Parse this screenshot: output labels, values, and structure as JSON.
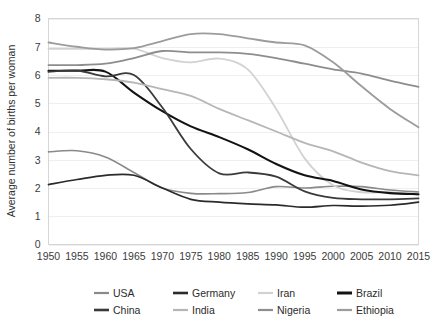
{
  "chart_data": {
    "type": "line",
    "title": "",
    "xlabel": "",
    "ylabel": "Average number of births per woman",
    "xlim": [
      1950,
      2015
    ],
    "ylim": [
      0,
      8
    ],
    "grid": true,
    "legend_position": "bottom",
    "x": [
      1950,
      1955,
      1960,
      1965,
      1970,
      1975,
      1980,
      1985,
      1990,
      1995,
      2000,
      2005,
      2010,
      2015
    ],
    "xtick_labels": [
      "1950",
      "1955",
      "1960",
      "1965",
      "1970",
      "1975",
      "1980",
      "1985",
      "1990",
      "1995",
      "2000",
      "2005",
      "2010",
      "2015"
    ],
    "ytick_labels": [
      "0",
      "1",
      "2",
      "3",
      "4",
      "5",
      "6",
      "7",
      "8"
    ],
    "ytick_values": [
      0,
      1,
      2,
      3,
      4,
      5,
      6,
      7,
      8
    ],
    "series": [
      {
        "name": "USA",
        "color": "#8a8a8a",
        "width": 1.6,
        "values": [
          3.28,
          3.32,
          3.1,
          2.55,
          2.0,
          1.81,
          1.8,
          1.84,
          2.05,
          2.0,
          2.06,
          2.05,
          1.93,
          1.86
        ]
      },
      {
        "name": "Germany",
        "color": "#2b2b2b",
        "width": 1.7,
        "values": [
          2.12,
          2.3,
          2.45,
          2.45,
          2.0,
          1.6,
          1.5,
          1.44,
          1.4,
          1.32,
          1.38,
          1.36,
          1.39,
          1.5
        ]
      },
      {
        "name": "Iran",
        "color": "#d2d2d2",
        "width": 1.8,
        "values": [
          6.93,
          6.93,
          6.93,
          6.93,
          6.6,
          6.45,
          6.58,
          6.2,
          4.8,
          3.05,
          2.1,
          1.85,
          1.85,
          1.75
        ]
      },
      {
        "name": "Brazil",
        "color": "#131313",
        "width": 2.1,
        "values": [
          6.15,
          6.15,
          6.12,
          5.38,
          4.72,
          4.18,
          3.8,
          3.37,
          2.85,
          2.45,
          2.25,
          1.95,
          1.82,
          1.78
        ]
      },
      {
        "name": "China",
        "color": "#3a3a3a",
        "width": 1.8,
        "values": [
          6.11,
          6.16,
          5.95,
          6.0,
          4.85,
          3.38,
          2.52,
          2.55,
          2.4,
          1.88,
          1.65,
          1.6,
          1.6,
          1.63
        ]
      },
      {
        "name": "India",
        "color": "#b6b6b6",
        "width": 1.8,
        "values": [
          5.9,
          5.9,
          5.85,
          5.73,
          5.5,
          5.26,
          4.8,
          4.4,
          4.0,
          3.6,
          3.3,
          2.9,
          2.6,
          2.45
        ]
      },
      {
        "name": "Nigeria",
        "color": "#8d8d8d",
        "width": 1.8,
        "values": [
          6.35,
          6.35,
          6.4,
          6.6,
          6.85,
          6.8,
          6.8,
          6.75,
          6.6,
          6.4,
          6.2,
          6.05,
          5.8,
          5.58
        ]
      },
      {
        "name": "Ethiopia",
        "color": "#9c9c9c",
        "width": 1.8,
        "values": [
          7.15,
          7.0,
          6.9,
          6.95,
          7.2,
          7.45,
          7.45,
          7.3,
          7.15,
          7.05,
          6.45,
          5.6,
          4.8,
          4.15
        ]
      }
    ]
  },
  "legend": {
    "entries": [
      {
        "label": "USA",
        "color": "#8a8a8a",
        "width": 2.2
      },
      {
        "label": "Germany",
        "color": "#2b2b2b",
        "width": 2.6
      },
      {
        "label": "Iran",
        "color": "#d2d2d2",
        "width": 2.2
      },
      {
        "label": "Brazil",
        "color": "#131313",
        "width": 3.0
      },
      {
        "label": "China",
        "color": "#3a3a3a",
        "width": 2.6
      },
      {
        "label": "India",
        "color": "#b6b6b6",
        "width": 2.2
      },
      {
        "label": "Nigeria",
        "color": "#8d8d8d",
        "width": 2.2
      },
      {
        "label": "Ethiopia",
        "color": "#9c9c9c",
        "width": 2.2
      }
    ]
  },
  "colors": {
    "background": "#ffffff",
    "grid": "#efefef",
    "frame": "#d6d6d6",
    "text": "#2f2f2f"
  }
}
